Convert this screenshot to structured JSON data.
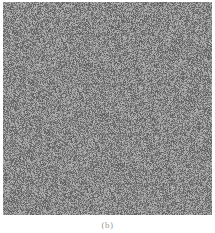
{
  "figure": {
    "image": {
      "description": "gray random noise texture",
      "base_color": "#8a8a8a",
      "noise_min": "#5a5a5a",
      "noise_max": "#b8b8b8"
    },
    "caption": "(b)"
  }
}
